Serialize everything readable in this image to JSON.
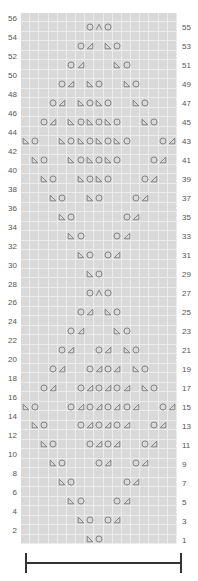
{
  "chart_data": {
    "type": "table",
    "title": "",
    "grid": {
      "columns": 17,
      "rows": 56
    },
    "legend": {
      "O": "yarn-over",
      "L": "left-leaning decrease (ssk)",
      "R": "right-leaning decrease (k2tog)",
      "A": "centered double decrease"
    },
    "row_labels_left": [
      56,
      54,
      52,
      50,
      48,
      46,
      44,
      42,
      40,
      38,
      36,
      34,
      32,
      30,
      28,
      26,
      24,
      22,
      20,
      18,
      16,
      14,
      12,
      10,
      8,
      6,
      4,
      2
    ],
    "row_labels_right": [
      55,
      53,
      51,
      49,
      47,
      45,
      43,
      41,
      39,
      37,
      35,
      33,
      31,
      29,
      27,
      25,
      23,
      21,
      19,
      17,
      15,
      13,
      11,
      9,
      7,
      5,
      3,
      1
    ],
    "rows": {
      "55": [
        [
          8,
          "O"
        ],
        [
          9,
          "A"
        ],
        [
          10,
          "O"
        ]
      ],
      "53": [
        [
          7,
          "O"
        ],
        [
          8,
          "R"
        ],
        [
          10,
          "L"
        ],
        [
          11,
          "O"
        ]
      ],
      "51": [
        [
          6,
          "O"
        ],
        [
          7,
          "R"
        ],
        [
          11,
          "L"
        ],
        [
          12,
          "O"
        ]
      ],
      "49": [
        [
          5,
          "O"
        ],
        [
          6,
          "R"
        ],
        [
          8,
          "L"
        ],
        [
          9,
          "O"
        ],
        [
          12,
          "L"
        ],
        [
          13,
          "O"
        ]
      ],
      "47": [
        [
          4,
          "O"
        ],
        [
          5,
          "R"
        ],
        [
          7,
          "L"
        ],
        [
          8,
          "O"
        ],
        [
          9,
          "L"
        ],
        [
          10,
          "O"
        ],
        [
          13,
          "L"
        ],
        [
          14,
          "O"
        ]
      ],
      "45": [
        [
          3,
          "O"
        ],
        [
          4,
          "R"
        ],
        [
          6,
          "L"
        ],
        [
          7,
          "O"
        ],
        [
          8,
          "L"
        ],
        [
          9,
          "O"
        ],
        [
          10,
          "L"
        ],
        [
          11,
          "O"
        ],
        [
          14,
          "L"
        ],
        [
          15,
          "O"
        ]
      ],
      "43": [
        [
          1,
          "L"
        ],
        [
          2,
          "O"
        ],
        [
          5,
          "L"
        ],
        [
          6,
          "O"
        ],
        [
          7,
          "L"
        ],
        [
          8,
          "O"
        ],
        [
          9,
          "L"
        ],
        [
          10,
          "O"
        ],
        [
          11,
          "L"
        ],
        [
          12,
          "O"
        ],
        [
          16,
          "O"
        ],
        [
          17,
          "R"
        ]
      ],
      "41": [
        [
          2,
          "L"
        ],
        [
          3,
          "O"
        ],
        [
          6,
          "L"
        ],
        [
          7,
          "O"
        ],
        [
          8,
          "L"
        ],
        [
          9,
          "O"
        ],
        [
          10,
          "L"
        ],
        [
          11,
          "O"
        ],
        [
          15,
          "O"
        ],
        [
          16,
          "R"
        ]
      ],
      "39": [
        [
          3,
          "L"
        ],
        [
          4,
          "O"
        ],
        [
          7,
          "L"
        ],
        [
          8,
          "O"
        ],
        [
          9,
          "L"
        ],
        [
          10,
          "O"
        ],
        [
          14,
          "O"
        ],
        [
          15,
          "R"
        ]
      ],
      "37": [
        [
          4,
          "L"
        ],
        [
          5,
          "O"
        ],
        [
          8,
          "L"
        ],
        [
          9,
          "O"
        ],
        [
          13,
          "O"
        ],
        [
          14,
          "R"
        ]
      ],
      "35": [
        [
          5,
          "L"
        ],
        [
          6,
          "O"
        ],
        [
          12,
          "O"
        ],
        [
          13,
          "R"
        ]
      ],
      "33": [
        [
          6,
          "L"
        ],
        [
          7,
          "O"
        ],
        [
          11,
          "O"
        ],
        [
          12,
          "R"
        ]
      ],
      "31": [
        [
          7,
          "L"
        ],
        [
          8,
          "O"
        ],
        [
          10,
          "O"
        ],
        [
          11,
          "R"
        ]
      ],
      "29": [
        [
          8,
          "L"
        ],
        [
          9,
          "O"
        ]
      ],
      "27": [
        [
          8,
          "O"
        ],
        [
          9,
          "A"
        ],
        [
          10,
          "O"
        ]
      ],
      "25": [
        [
          7,
          "O"
        ],
        [
          8,
          "R"
        ],
        [
          10,
          "L"
        ],
        [
          11,
          "O"
        ]
      ],
      "23": [
        [
          6,
          "O"
        ],
        [
          7,
          "R"
        ],
        [
          11,
          "L"
        ],
        [
          12,
          "O"
        ]
      ],
      "21": [
        [
          5,
          "O"
        ],
        [
          6,
          "R"
        ],
        [
          9,
          "O"
        ],
        [
          10,
          "R"
        ],
        [
          12,
          "L"
        ],
        [
          13,
          "O"
        ]
      ],
      "19": [
        [
          4,
          "O"
        ],
        [
          5,
          "R"
        ],
        [
          8,
          "O"
        ],
        [
          9,
          "R"
        ],
        [
          10,
          "O"
        ],
        [
          11,
          "R"
        ],
        [
          13,
          "L"
        ],
        [
          14,
          "O"
        ]
      ],
      "17": [
        [
          3,
          "O"
        ],
        [
          4,
          "R"
        ],
        [
          7,
          "O"
        ],
        [
          8,
          "R"
        ],
        [
          9,
          "O"
        ],
        [
          10,
          "R"
        ],
        [
          11,
          "O"
        ],
        [
          12,
          "R"
        ],
        [
          14,
          "L"
        ],
        [
          15,
          "O"
        ]
      ],
      "15": [
        [
          1,
          "L"
        ],
        [
          2,
          "O"
        ],
        [
          6,
          "O"
        ],
        [
          7,
          "R"
        ],
        [
          8,
          "O"
        ],
        [
          9,
          "R"
        ],
        [
          10,
          "O"
        ],
        [
          11,
          "R"
        ],
        [
          12,
          "O"
        ],
        [
          13,
          "R"
        ],
        [
          16,
          "O"
        ],
        [
          17,
          "R"
        ]
      ],
      "13": [
        [
          2,
          "L"
        ],
        [
          3,
          "O"
        ],
        [
          7,
          "O"
        ],
        [
          8,
          "R"
        ],
        [
          9,
          "O"
        ],
        [
          10,
          "R"
        ],
        [
          11,
          "O"
        ],
        [
          12,
          "R"
        ],
        [
          15,
          "O"
        ],
        [
          16,
          "R"
        ]
      ],
      "11": [
        [
          3,
          "L"
        ],
        [
          4,
          "O"
        ],
        [
          8,
          "O"
        ],
        [
          9,
          "R"
        ],
        [
          10,
          "O"
        ],
        [
          11,
          "R"
        ],
        [
          14,
          "O"
        ],
        [
          15,
          "R"
        ]
      ],
      "9": [
        [
          4,
          "L"
        ],
        [
          5,
          "O"
        ],
        [
          9,
          "O"
        ],
        [
          10,
          "R"
        ],
        [
          13,
          "O"
        ],
        [
          14,
          "R"
        ]
      ],
      "7": [
        [
          5,
          "L"
        ],
        [
          6,
          "O"
        ],
        [
          12,
          "O"
        ],
        [
          13,
          "R"
        ]
      ],
      "5": [
        [
          6,
          "L"
        ],
        [
          7,
          "O"
        ],
        [
          11,
          "O"
        ],
        [
          12,
          "R"
        ]
      ],
      "3": [
        [
          7,
          "L"
        ],
        [
          8,
          "O"
        ],
        [
          10,
          "O"
        ],
        [
          11,
          "R"
        ]
      ],
      "1": [
        [
          8,
          "L"
        ],
        [
          9,
          "O"
        ]
      ]
    },
    "repeat_bracket": {
      "from_col": 1,
      "to_col": 17
    }
  },
  "colors": {
    "grid_bg": "#d9d9d9",
    "grid_line": "#ececec",
    "symbol": "#7a7a7a",
    "label": "#555555",
    "bracket": "#333333"
  }
}
